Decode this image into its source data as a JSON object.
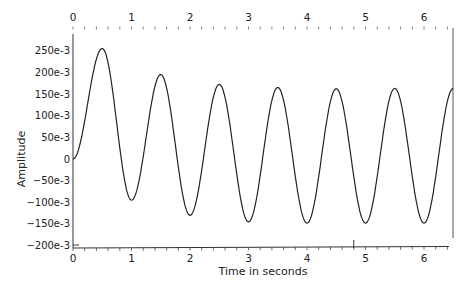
{
  "chart_data": {
    "type": "line",
    "title": "",
    "xlabel": "Time in seconds",
    "ylabel": "Amplitude",
    "xlim": [
      0,
      6.5
    ],
    "ylim": [
      -0.2,
      0.26
    ],
    "grid": false,
    "legend": null,
    "x_ticks": [
      "0",
      "1",
      "2",
      "3",
      "4",
      "5",
      "6"
    ],
    "x_tick_values": [
      0,
      1,
      2,
      3,
      4,
      5,
      6
    ],
    "top_x_ticks": [
      "0",
      "1",
      "2",
      "3",
      "4",
      "5",
      "6"
    ],
    "y_ticks": [
      "250e-3",
      "200e-3",
      "150e-3",
      "100e-3",
      "50e-3",
      "0",
      "−50e-3",
      "−100e-3",
      "−150e-3",
      "−200e-3"
    ],
    "y_tick_values": [
      0.25,
      0.2,
      0.15,
      0.1,
      0.05,
      0,
      -0.05,
      -0.1,
      -0.15,
      -0.2
    ],
    "series": [
      {
        "name": "Amplitude",
        "color": "#222222",
        "x": [
          0,
          0.25,
          0.5,
          0.75,
          1.0,
          1.25,
          1.5,
          1.75,
          2.0,
          2.25,
          2.5,
          2.75,
          3.0,
          3.25,
          3.5,
          3.75,
          4.0,
          4.25,
          4.5,
          4.75,
          5.0,
          5.25,
          5.5,
          5.75,
          6.0,
          6.25,
          6.5
        ],
        "values": [
          0,
          0.13,
          0.255,
          0.08,
          -0.095,
          0.05,
          0.195,
          0.03,
          -0.13,
          0.02,
          0.172,
          0.013,
          -0.145,
          0.01,
          0.165,
          0.008,
          -0.148,
          0.007,
          0.162,
          0.007,
          -0.148,
          0.007,
          0.163,
          0.007,
          -0.148,
          0.007,
          0.163
        ]
      }
    ],
    "peaks": [
      {
        "t": 0.5,
        "value": 0.255
      },
      {
        "t": 1.5,
        "value": 0.195
      },
      {
        "t": 2.5,
        "value": 0.172
      },
      {
        "t": 3.5,
        "value": 0.165
      },
      {
        "t": 4.5,
        "value": 0.162
      },
      {
        "t": 5.5,
        "value": 0.163
      },
      {
        "t": 6.5,
        "value": 0.163
      }
    ],
    "troughs": [
      {
        "t": 1.0,
        "value": -0.095
      },
      {
        "t": 2.0,
        "value": -0.13
      },
      {
        "t": 3.0,
        "value": -0.145
      },
      {
        "t": 4.0,
        "value": -0.148
      },
      {
        "t": 5.0,
        "value": -0.148
      },
      {
        "t": 6.0,
        "value": -0.148
      }
    ]
  }
}
